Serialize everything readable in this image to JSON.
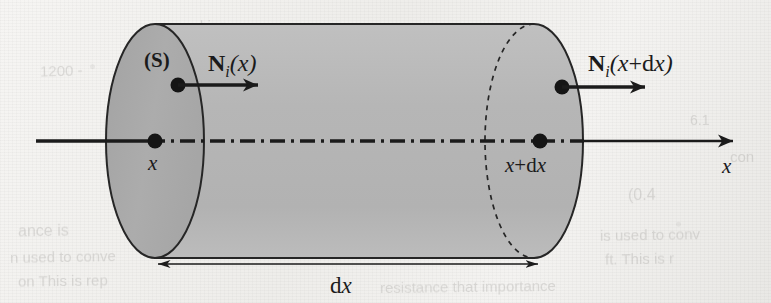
{
  "figure": {
    "type": "control-volume-cylinder-diagram",
    "background_color": "#f1f0ed",
    "ink_color": "#1a1a1a",
    "cylinder_body_color": "#b8b8b8",
    "cylinder_face_color": "#a9a9a9",
    "geometry": {
      "left_face_center_x": 155,
      "right_face_center_x": 534,
      "axis_y": 141,
      "radius_x": 49,
      "radius_y": 117,
      "top_y": 24,
      "bottom_y": 258
    },
    "labels": {
      "surface": "(S)",
      "flux_in_bold": "N",
      "flux_in_sub": "i",
      "flux_in_arg": "(x)",
      "flux_out_bold": "N",
      "flux_out_sub": "i",
      "flux_out_arg_x": "(x",
      "flux_out_arg_plus": "+",
      "flux_out_arg_d": "d",
      "flux_out_arg_x2": "x)",
      "axis_point_left": "x",
      "axis_point_right_x": "x",
      "axis_point_right_plus": "+",
      "axis_point_right_d": "d",
      "axis_point_right_x2": "x",
      "axis_name": "x",
      "dimension_d": "d",
      "dimension_x": "x"
    },
    "ghost_text": [
      {
        "text": "1200 -",
        "x": 40,
        "y": 62,
        "size": 15,
        "rotate": -1.5
      },
      {
        "text": "hing",
        "x": 200,
        "y": 18,
        "size": 14,
        "rotate": -1
      },
      {
        "text": "ance is",
        "x": 18,
        "y": 222,
        "size": 16,
        "rotate": -1
      },
      {
        "text": "n used to  conve",
        "x": 10,
        "y": 248,
        "size": 15,
        "rotate": -1
      },
      {
        "text": "on  This is  rep",
        "x": 18,
        "y": 272,
        "size": 15,
        "rotate": -0.8
      },
      {
        "text": "(0.4",
        "x": 628,
        "y": 186,
        "size": 16,
        "rotate": -1
      },
      {
        "text": "is used to  conv",
        "x": 600,
        "y": 226,
        "size": 15,
        "rotate": -1
      },
      {
        "text": "ft.   This is  r",
        "x": 605,
        "y": 250,
        "size": 15,
        "rotate": -1
      },
      {
        "text": "resistance  that  importance",
        "x": 380,
        "y": 278,
        "size": 15,
        "rotate": -0.7
      },
      {
        "text": "con",
        "x": 730,
        "y": 148,
        "size": 15,
        "rotate": -1
      },
      {
        "text": "23.2",
        "x": 450,
        "y": 96,
        "size": 14,
        "rotate": -1
      },
      {
        "text": "6.1",
        "x": 690,
        "y": 112,
        "size": 14,
        "rotate": -1
      }
    ]
  }
}
